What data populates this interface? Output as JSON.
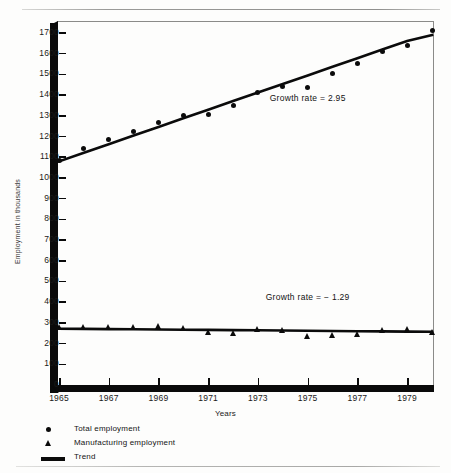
{
  "chart_data": {
    "type": "scatter",
    "title": "",
    "xlabel": "Years",
    "ylabel": "Employment in thousands",
    "xlim": [
      1965,
      1980
    ],
    "ylim": [
      0,
      1700
    ],
    "yticks": [
      0,
      100,
      200,
      300,
      400,
      500,
      600,
      700,
      800,
      900,
      1000,
      1100,
      1200,
      1300,
      1400,
      1500,
      1600,
      1700
    ],
    "xticks": [
      1965,
      1967,
      1969,
      1971,
      1973,
      1975,
      1977,
      1979
    ],
    "xtick_labels": [
      "1965",
      "1967",
      "1969",
      "1971",
      "1973",
      "1975",
      "1977",
      "1979"
    ],
    "grid": false,
    "legend_position": "below-axes-left",
    "x": [
      1965,
      1966,
      1967,
      1968,
      1969,
      1970,
      1971,
      1972,
      1973,
      1974,
      1975,
      1976,
      1977,
      1978,
      1979,
      1980
    ],
    "series": [
      {
        "name": "Total employment",
        "marker": "circle",
        "values": [
          1085,
          1140,
          1185,
          1225,
          1270,
          1300,
          1305,
          1350,
          1415,
          1440,
          1435,
          1505,
          1555,
          1610,
          1640,
          1710
        ]
      },
      {
        "name": "Manufacturing employment",
        "marker": "triangle",
        "values": [
          278,
          281,
          280,
          282,
          287,
          274,
          258,
          252,
          271,
          264,
          235,
          242,
          245,
          265,
          272,
          255
        ]
      },
      {
        "name": "Trend (Total employment)",
        "marker": "line",
        "values": [
          1080,
          1122,
          1163,
          1205,
          1246,
          1288,
          1329,
          1371,
          1412,
          1454,
          1495,
          1537,
          1578,
          1620,
          1661,
          1690
        ]
      },
      {
        "name": "Trend (Manufacturing employment)",
        "marker": "line",
        "values": [
          272,
          271,
          270,
          269,
          268,
          267,
          266,
          265,
          264,
          263,
          262,
          261,
          260,
          259,
          258,
          257
        ]
      }
    ],
    "annotations": [
      {
        "text": "Growth rate = 2.95",
        "x": 1975,
        "y": 1380
      },
      {
        "text": "Growth rate = − 1.29",
        "x": 1975,
        "y": 420
      }
    ]
  },
  "legend": {
    "items": [
      {
        "label": "Total employment",
        "marker": "circle"
      },
      {
        "label": "Manufacturing employment",
        "marker": "triangle"
      },
      {
        "label": "Trend",
        "marker": "line"
      }
    ]
  }
}
